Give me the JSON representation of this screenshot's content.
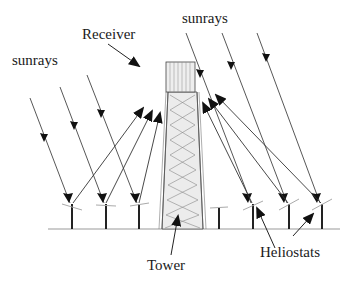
{
  "figure": {
    "type": "solar power tower diagram",
    "labels": {
      "sunrays_left": "sunrays",
      "sunrays_right": "sunrays",
      "receiver": "Receiver",
      "tower": "Tower",
      "heliostats": "Heliostats"
    },
    "colors": {
      "line": "#333333",
      "arrow": "#111111",
      "mirror": "#aaaaaa",
      "tower_fill": "#e6e6e6",
      "receiver_fill": "#eeeeee"
    },
    "heliostats": [
      {
        "x": 72,
        "active": true
      },
      {
        "x": 106,
        "active": true
      },
      {
        "x": 139,
        "active": true
      },
      {
        "x": 219,
        "active": false
      },
      {
        "x": 253,
        "active": true
      },
      {
        "x": 289,
        "active": true
      },
      {
        "x": 322,
        "active": true
      }
    ]
  }
}
